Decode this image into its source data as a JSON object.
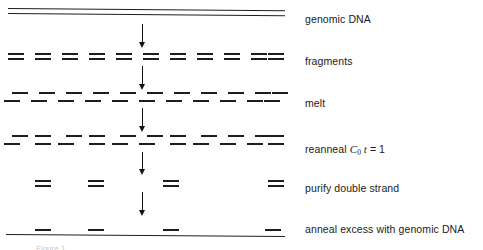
{
  "figure": {
    "line_color": "#1d1d1d",
    "background": "#ffffff",
    "caption_partial": "Figure 1"
  },
  "rows": [
    {
      "key": "genomic_dna",
      "label": "genomic DNA",
      "label_y": 14,
      "type": "duplex-line",
      "description": "continuous double-stranded genomic DNA drawn as two long parallel lines"
    },
    {
      "key": "fragments",
      "label": "fragments",
      "label_y": 56,
      "type": "duplex-dashes",
      "count": 11,
      "description": "eleven short double-stranded fragments, both strands aligned"
    },
    {
      "key": "melt",
      "label": "melt",
      "label_y": 98,
      "type": "melted-dashes",
      "count": 11,
      "description": "single strands separated, upper dash offset right and lower dash offset left"
    },
    {
      "key": "reanneal",
      "label": "reanneal",
      "label_y": 144,
      "type": "mixed-dashes",
      "count": 11,
      "formula": {
        "variable_c": "C",
        "subscript": "0",
        "variable_t": "t",
        "equals": "= 1"
      },
      "description": "some fragments reannealed into aligned duplexes, others remain offset single strands"
    },
    {
      "key": "purify",
      "label": "purify double strand",
      "label_y": 183,
      "type": "duplex-dashes",
      "count": 4,
      "description": "only the four reannealed double-stranded species remain"
    },
    {
      "key": "anneal_excess",
      "label": "anneal excess with genomic DNA",
      "label_y": 224,
      "type": "line-with-dashes",
      "count": 4,
      "description": "purified repeats annealed back onto a long genomic DNA line"
    }
  ],
  "arrows": [
    {
      "name": "arrow-genomic-to-fragments",
      "x": 142,
      "y_top": 24,
      "y_bottom": 48
    },
    {
      "name": "arrow-fragments-to-melt",
      "x": 142,
      "y_top": 66,
      "y_bottom": 90
    },
    {
      "name": "arrow-melt-to-reanneal",
      "x": 142,
      "y_top": 108,
      "y_bottom": 132
    },
    {
      "name": "arrow-reanneal-to-purify",
      "x": 142,
      "y_top": 152,
      "y_bottom": 175
    },
    {
      "name": "arrow-purify-to-anneal",
      "x": 142,
      "y_top": 192,
      "y_bottom": 216
    }
  ],
  "geometry": {
    "genomic_top": {
      "x": 8,
      "width": 277,
      "y_upper": 8,
      "y_lower": 13
    },
    "genomic_bottom": {
      "x": 6,
      "width": 279,
      "y": 234
    },
    "fragment_xs": [
      8,
      35,
      62,
      89,
      116,
      143,
      170,
      197,
      224,
      251,
      268
    ],
    "fragment_dash_width": 16,
    "fragments_y_upper": 53,
    "fragments_y_lower": 58,
    "melt_y_upper": 92,
    "melt_y_lower": 100,
    "melt_offset": 4,
    "reanneal_y_upper": 135,
    "reanneal_y_lower": 143,
    "reanneal_aligned_indices": [
      1,
      3,
      6,
      10
    ],
    "purify_xs": [
      35,
      88,
      163,
      268
    ],
    "purify_y_upper": 180,
    "purify_y_lower": 185,
    "anneal_dash_xs": [
      35,
      88,
      163,
      265
    ],
    "anneal_dash_y": 229
  }
}
